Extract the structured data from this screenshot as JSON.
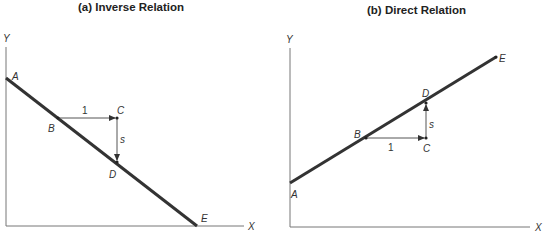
{
  "panels": [
    {
      "id": "a",
      "title": "(a) Inverse Relation",
      "axes": {
        "x_label": "X",
        "y_label": "Y"
      },
      "points": {
        "A": "A",
        "B": "B",
        "C": "C",
        "D": "D",
        "E": "E"
      },
      "run_label": "1",
      "rise_label": "s"
    },
    {
      "id": "b",
      "title": "(b) Direct Relation",
      "axes": {
        "x_label": "X",
        "y_label": "Y"
      },
      "points": {
        "A": "A",
        "B": "B",
        "C": "C",
        "D": "D",
        "E": "E"
      },
      "run_label": "1",
      "rise_label": "s"
    }
  ],
  "colors": {
    "line": "#333333",
    "axis": "#777777",
    "arrow": "#555555"
  }
}
